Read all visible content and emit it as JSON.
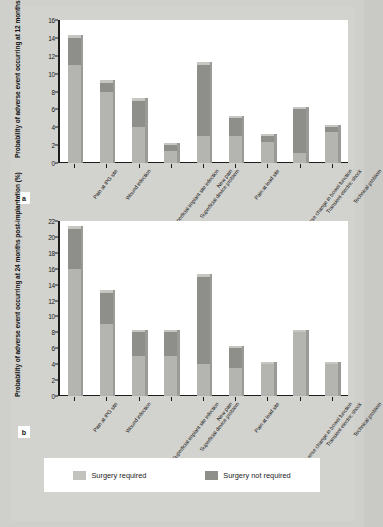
{
  "figure": {
    "panels": [
      {
        "letter": "a"
      },
      {
        "letter": "b"
      }
    ]
  },
  "legend": {
    "items": [
      {
        "label": "Surgery required",
        "color": "#c2c2be"
      },
      {
        "label": "Surgery not required",
        "color": "#8e8e8b"
      }
    ]
  },
  "chart_data": [
    {
      "type": "bar",
      "id": "panel-a",
      "panel_letter": "a",
      "title": "",
      "stacked": true,
      "xlabel": "",
      "ylabel": "Probability of adverse event occurring at 12 months post-implantation (%)",
      "ylim": [
        0,
        16
      ],
      "yticks": [
        0,
        2,
        4,
        6,
        8,
        10,
        12,
        14,
        16
      ],
      "ytick_labels": [
        "0",
        "2",
        "4",
        "6",
        "8",
        "10",
        "12",
        "14",
        "16"
      ],
      "grid": false,
      "legend_position": "bottom-shared",
      "categories": [
        "Pain at IPG site",
        "Wound infection",
        "Superficial implant site infection",
        "Superficial device problem",
        "New pain",
        "Pain at lead site",
        "Adverse change in bowel function",
        "Transient electric shock",
        "Technical problem"
      ],
      "series": [
        {
          "name": "Surgery required",
          "color": "#c2c2be",
          "values": [
            11.0,
            8.0,
            4.0,
            1.3,
            3.0,
            3.0,
            2.3,
            1.1,
            3.5
          ]
        },
        {
          "name": "Surgery not required",
          "color": "#8e8e8b",
          "values": [
            3.0,
            1.0,
            3.0,
            0.7,
            8.0,
            2.0,
            0.7,
            4.9,
            0.5
          ]
        }
      ],
      "totals": [
        14.0,
        9.0,
        7.0,
        2.0,
        11.0,
        5.0,
        3.0,
        6.0,
        4.0
      ]
    },
    {
      "type": "bar",
      "id": "panel-b",
      "panel_letter": "b",
      "title": "",
      "stacked": true,
      "xlabel": "",
      "ylabel": "Probability of adverse event occurring at 24 months post-implantation (%)",
      "ylim": [
        0,
        22
      ],
      "yticks": [
        0,
        2,
        4,
        6,
        8,
        10,
        12,
        14,
        16,
        18,
        20,
        22
      ],
      "ytick_labels": [
        "0",
        "2",
        "4",
        "6",
        "8",
        "10",
        "12",
        "14",
        "16",
        "18",
        "20",
        "22"
      ],
      "grid": false,
      "legend_position": "bottom-shared",
      "categories": [
        "Pain at IPG site",
        "Wound infection",
        "Superficial implant site infection",
        "Superficial device problem",
        "New pain",
        "Pain at lead site",
        "Adverse change in bowel function",
        "Transient electric shock",
        "Technical problem"
      ],
      "series": [
        {
          "name": "Surgery required",
          "color": "#c2c2be",
          "values": [
            16.0,
            9.0,
            5.0,
            5.0,
            4.0,
            3.5,
            4.0,
            8.0,
            4.0
          ]
        },
        {
          "name": "Surgery not required",
          "color": "#8e8e8b",
          "values": [
            5.0,
            4.0,
            3.0,
            3.0,
            11.0,
            2.5,
            0.0,
            0.0,
            0.0
          ]
        }
      ],
      "totals": [
        21.0,
        13.0,
        8.0,
        8.0,
        15.0,
        6.0,
        4.0,
        8.0,
        4.0
      ]
    }
  ]
}
